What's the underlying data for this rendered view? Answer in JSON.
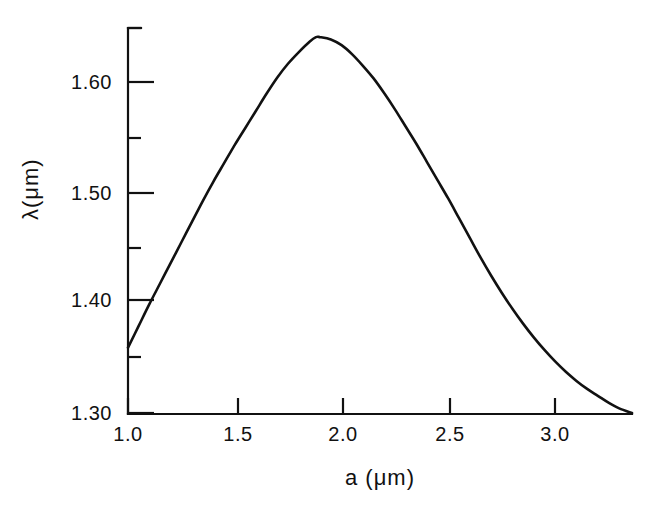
{
  "chart_data": {
    "type": "line",
    "title": "",
    "subtitle": "",
    "xlabel": "a (μm)",
    "ylabel": "λ(μm)",
    "xlim": [
      1.0,
      3.36
    ],
    "ylim": [
      1.3,
      1.636
    ],
    "grid": false,
    "legend": null,
    "annotations": [],
    "xticks": [
      1.0,
      1.5,
      2.0,
      2.5,
      3.0
    ],
    "xtick_labels": [
      "1.0",
      "1.5",
      "2.0",
      "2.5",
      "3.0"
    ],
    "xminor_ticks": [
      1.25,
      1.75,
      2.25,
      2.75,
      3.25
    ],
    "yticks": [
      1.3,
      1.4,
      1.5,
      1.6
    ],
    "ytick_labels": [
      "1.30",
      "1.40",
      "1.50",
      "1.60"
    ],
    "yminor_ticks": [
      1.35,
      1.45,
      1.55,
      1.65
    ],
    "series": [
      {
        "name": "lambda-vs-a",
        "color": "#111111",
        "x": [
          1.0,
          1.05,
          1.1,
          1.15,
          1.2,
          1.25,
          1.3,
          1.35,
          1.4,
          1.45,
          1.5,
          1.55,
          1.6,
          1.65,
          1.7,
          1.75,
          1.8,
          1.85,
          1.88,
          1.9,
          1.95,
          2.0,
          2.05,
          2.1,
          2.15,
          2.2,
          2.25,
          2.3,
          2.35,
          2.4,
          2.45,
          2.5,
          2.55,
          2.6,
          2.65,
          2.7,
          2.75,
          2.8,
          2.85,
          2.9,
          2.95,
          3.0,
          3.05,
          3.1,
          3.15,
          3.2,
          3.25,
          3.3,
          3.36
        ],
        "y": [
          1.357,
          1.376,
          1.395,
          1.413,
          1.431,
          1.449,
          1.467,
          1.485,
          1.502,
          1.518,
          1.534,
          1.549,
          1.564,
          1.579,
          1.593,
          1.605,
          1.615,
          1.624,
          1.628,
          1.628,
          1.626,
          1.621,
          1.613,
          1.603,
          1.592,
          1.579,
          1.565,
          1.55,
          1.535,
          1.519,
          1.503,
          1.487,
          1.47,
          1.453,
          1.436,
          1.42,
          1.405,
          1.391,
          1.378,
          1.366,
          1.355,
          1.345,
          1.336,
          1.328,
          1.321,
          1.315,
          1.309,
          1.304,
          1.3
        ]
      }
    ],
    "peak": {
      "a": 1.88,
      "lambda": 1.628
    }
  },
  "axes": {
    "x_label": "a (μm)",
    "y_label": "λ(μm)",
    "x_tick_labels": [
      "1.0",
      "1.5",
      "2.0",
      "2.5",
      "3.0"
    ],
    "y_tick_labels": [
      "1.60",
      "1.50",
      "1.40",
      "1.30"
    ]
  },
  "style": {
    "line_color": "#111111",
    "axis_color": "#111111",
    "background": "#ffffff"
  }
}
